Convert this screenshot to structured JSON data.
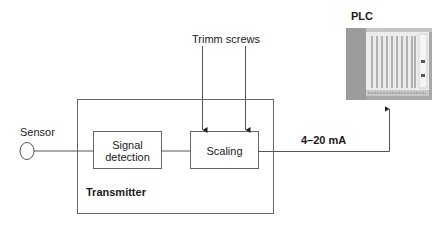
{
  "diagram": {
    "sensor": {
      "label": "Sensor"
    },
    "transmitter": {
      "label": "Transmitter",
      "blocks": [
        {
          "id": "signal-detection",
          "label_line1": "Signal",
          "label_line2": "detection"
        },
        {
          "id": "scaling",
          "label": "Scaling"
        }
      ]
    },
    "trimm_screws": {
      "label": "Trimm screws"
    },
    "output_signal": {
      "label": "4–20 mA"
    },
    "plc": {
      "label": "PLC"
    },
    "colors": {
      "line": "#555555",
      "box_border": "#666666",
      "plc_frame": "#9a9a9a",
      "plc_face": "#e4e4e4"
    }
  }
}
